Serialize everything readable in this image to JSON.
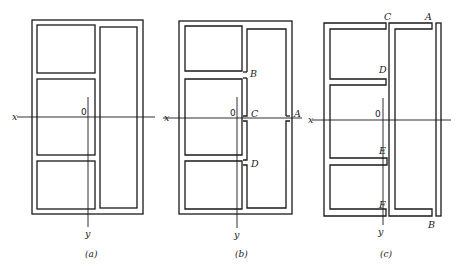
{
  "figures": [
    {
      "id": "a",
      "caption": "(a)",
      "axis_x_label": "x",
      "axis_y_label": "y",
      "origin_label": "0",
      "point_labels": []
    },
    {
      "id": "b",
      "caption": "(b)",
      "axis_x_label": "x",
      "axis_y_label": "y",
      "origin_label": "0",
      "point_labels": [
        "B",
        "C",
        "A",
        "D"
      ]
    },
    {
      "id": "c",
      "caption": "(c)",
      "axis_x_label": "x",
      "axis_y_label": "y",
      "origin_label": "0",
      "point_labels": [
        "C",
        "A",
        "D",
        "E",
        "F",
        "B"
      ]
    }
  ],
  "colors": {
    "stroke": "#1a1a1a",
    "background": "#ffffff"
  }
}
